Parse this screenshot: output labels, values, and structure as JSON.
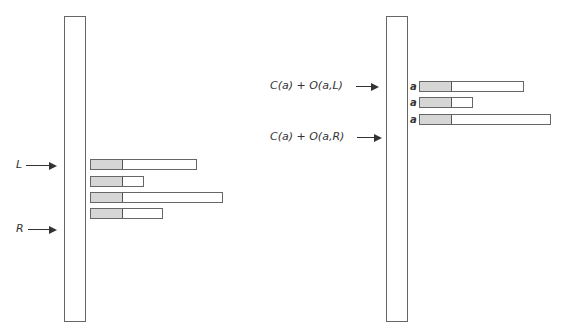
{
  "left_panel": {
    "pointers": [
      {
        "label": "L",
        "y": 165
      },
      {
        "label": "R",
        "y": 229
      }
    ],
    "bars": [
      {
        "y": 159,
        "width": 107
      },
      {
        "y": 176,
        "width": 54
      },
      {
        "y": 192,
        "width": 133
      },
      {
        "y": 208,
        "width": 73
      }
    ],
    "fill_width": 31
  },
  "right_panel": {
    "pointers": [
      {
        "label": "C(a) + O(a,L)",
        "y": 86
      },
      {
        "label": "C(a) + O(a,R)",
        "y": 137
      }
    ],
    "bars": [
      {
        "row_label": "a",
        "y": 81,
        "width": 105
      },
      {
        "row_label": "a",
        "y": 97,
        "width": 54
      },
      {
        "row_label": "a",
        "y": 114,
        "width": 132
      }
    ],
    "fill_width": 31
  },
  "colors": {
    "outline": "#666666",
    "fill": "#d6d6d6"
  }
}
